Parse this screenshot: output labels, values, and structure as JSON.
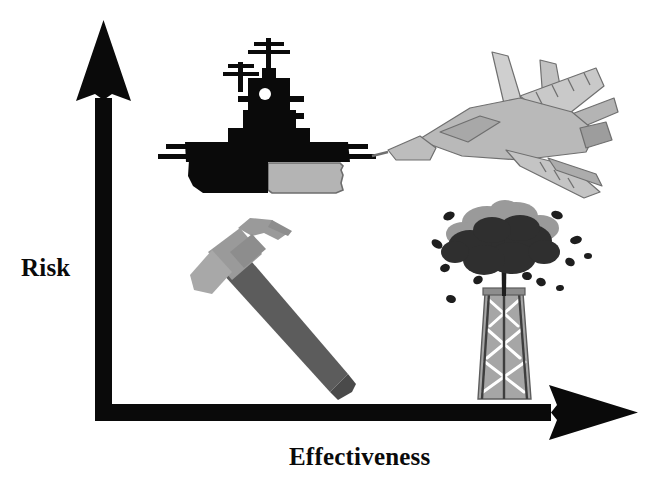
{
  "diagram": {
    "type": "conceptual-matrix",
    "title": "",
    "background_color": "#ffffff",
    "axis_color": "#0a0a0a"
  },
  "axes": {
    "y": {
      "label": "Risk",
      "direction": "up",
      "arrow": true,
      "ticks": [],
      "range_described": "low to high"
    },
    "x": {
      "label": "Effectiveness",
      "direction": "right",
      "arrow": true,
      "ticks": [],
      "range_described": "low to high"
    }
  },
  "quadrants": [
    {
      "id": "high-risk-low-effectiveness",
      "position": "top-left",
      "icon_name": "battleship-icon",
      "icon_label": "Battleship"
    },
    {
      "id": "high-risk-high-effectiveness",
      "position": "top-right",
      "icon_name": "fighter-jet-icon",
      "icon_label": "Fighter Jet"
    },
    {
      "id": "low-risk-low-effectiveness",
      "position": "bottom-left",
      "icon_name": "hammer-icon",
      "icon_label": "Claw Hammer"
    },
    {
      "id": "low-risk-high-effectiveness",
      "position": "bottom-right",
      "icon_name": "oil-rig-explosion-icon",
      "icon_label": "Oil Derrick with Explosion"
    }
  ],
  "palette": {
    "black": "#0a0a0a",
    "dark_gray": "#4a4a4a",
    "mid_gray": "#8d8d8d",
    "light_gray": "#b4b4b4",
    "pale_gray": "#cfcfcf",
    "cloud_dark": "#2f2f2f",
    "cloud_light": "#9a9a9a"
  }
}
